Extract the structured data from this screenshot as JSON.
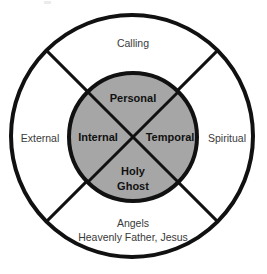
{
  "diagram": {
    "colors": {
      "background": "#ffffff",
      "stroke": "#111111",
      "inner_fill": "#a6a6a6",
      "ring_text": "#3a3a3a",
      "quadrant_text": "#111111"
    },
    "geometry": {
      "center_x": 132,
      "center_y": 136,
      "outer_radius": 123,
      "inner_radius": 66,
      "outer_stroke_width": 4,
      "inner_stroke_width": 4,
      "divider_stroke_width": 3,
      "divider_angles_deg": [
        45,
        135
      ]
    },
    "outer_ring": {
      "name": "outer-ring",
      "segments": [
        {
          "position": "top",
          "label": "Calling"
        },
        {
          "position": "left",
          "label": "External"
        },
        {
          "position": "right",
          "label": "Spiritual"
        },
        {
          "position": "bottom",
          "line1": "Angels",
          "line2": "Heavenly Father, Jesus"
        }
      ]
    },
    "inner_circle": {
      "name": "inner-circle",
      "quadrants": [
        {
          "position": "top",
          "label": "Personal"
        },
        {
          "position": "left",
          "label": "Internal"
        },
        {
          "position": "right",
          "label": "Temporal"
        },
        {
          "position": "bottom",
          "line1": "Holy",
          "line2": "Ghost"
        }
      ]
    }
  }
}
